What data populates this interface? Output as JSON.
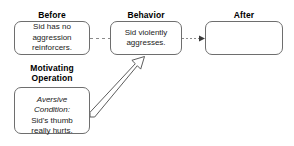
{
  "diagram": {
    "background_color": "#ffffff",
    "stroke_color": "#6e6e6e",
    "text_color": "#222222",
    "headings": {
      "before": "Before",
      "behavior": "Behavior",
      "after": "After",
      "motivating_operation": "Motivating\nOperation"
    },
    "boxes": {
      "before": {
        "text": "Sid has no\naggression\nreinforcers."
      },
      "behavior": {
        "text": "Sid violently\naggresses."
      },
      "after": {
        "text": ""
      },
      "motivating_operation": {
        "italic_text": "Aversive\nCondition:",
        "text": "Sid's thumb\nreally hurts."
      }
    },
    "connectors": {
      "before_to_behavior": {
        "style": "dashed",
        "arrowhead": "none"
      },
      "behavior_to_after": {
        "style": "dotted",
        "arrowhead": "solid-triangle"
      },
      "mo_to_behavior": {
        "style": "hollow-block-arrow",
        "arrowhead": "open-outline"
      }
    }
  }
}
